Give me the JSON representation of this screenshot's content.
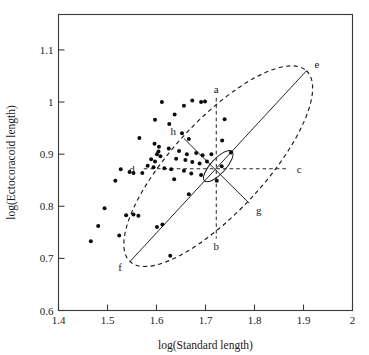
{
  "figure": {
    "kind": "scatter-plot-with-confidence-ellipse",
    "background": "#ffffff",
    "ink_color": "#1a1a1a"
  },
  "axes": {
    "x_title": "log(Standard length)",
    "y_title": "log(Ectocoracoid length)",
    "x_ticks": [
      "1.4",
      "1.5",
      "1.6",
      "1.7",
      "1.8",
      "1.9",
      "2"
    ],
    "y_ticks": [
      "0.6",
      "0.7",
      "0.8",
      "0.9",
      "1",
      "1.1"
    ]
  },
  "annotations": [
    {
      "key": "a",
      "label": "a",
      "x": 1.722,
      "y": 1.008,
      "anchor": "bottom-of-vertical-dashed-top"
    },
    {
      "key": "b",
      "label": "b",
      "x": 1.722,
      "y": 0.738,
      "anchor": "vertical-dashed-bottom"
    },
    {
      "key": "c",
      "label": "c",
      "x": 1.868,
      "y": 0.872,
      "anchor": "horizontal-dashed-right"
    },
    {
      "key": "d",
      "label": "d",
      "x": 1.574,
      "y": 0.872,
      "anchor": "horizontal-dashed-left"
    },
    {
      "key": "e",
      "label": "e",
      "x": 1.906,
      "y": 1.06,
      "anchor": "major-axis-upper-right"
    },
    {
      "key": "f",
      "label": "f",
      "x": 1.546,
      "y": 0.694,
      "anchor": "major-axis-lower-left"
    },
    {
      "key": "g",
      "label": "g",
      "x": 1.789,
      "y": 0.806,
      "anchor": "minor-axis-lower-right"
    },
    {
      "key": "h",
      "label": "h",
      "x": 1.656,
      "y": 0.93,
      "anchor": "minor-axis-upper-left"
    }
  ],
  "chart_data": {
    "type": "scatter",
    "title": "",
    "xlabel": "log(Standard length)",
    "ylabel": "log(Ectocoracoid length)",
    "xlim": [
      1.4,
      2.0
    ],
    "ylim": [
      0.6,
      1.168
    ],
    "xticks": [
      1.4,
      1.5,
      1.6,
      1.7,
      1.8,
      1.9,
      2.0
    ],
    "yticks": [
      0.6,
      0.7,
      0.8,
      0.9,
      1.0,
      1.1
    ],
    "grid": false,
    "legend": null,
    "marker": "filled-circle",
    "marker_color": "#0b0b0b",
    "points": [
      [
        1.611,
        1.0
      ],
      [
        1.673,
        1.003
      ],
      [
        1.691,
        1.0
      ],
      [
        1.699,
        1.001
      ],
      [
        1.637,
        0.976
      ],
      [
        1.656,
        0.993
      ],
      [
        1.739,
        0.967
      ],
      [
        1.597,
        0.966
      ],
      [
        1.626,
        0.958
      ],
      [
        1.652,
        0.94
      ],
      [
        1.565,
        0.931
      ],
      [
        1.596,
        0.92
      ],
      [
        1.666,
        0.929
      ],
      [
        1.734,
        0.926
      ],
      [
        1.605,
        0.914
      ],
      [
        1.625,
        0.911
      ],
      [
        1.646,
        0.906
      ],
      [
        1.662,
        0.9
      ],
      [
        1.681,
        0.902
      ],
      [
        1.694,
        0.898
      ],
      [
        1.712,
        0.9
      ],
      [
        1.752,
        0.903
      ],
      [
        1.601,
        0.9
      ],
      [
        1.604,
        0.905
      ],
      [
        1.608,
        0.896
      ],
      [
        1.589,
        0.89
      ],
      [
        1.597,
        0.886
      ],
      [
        1.64,
        0.891
      ],
      [
        1.659,
        0.889
      ],
      [
        1.673,
        0.885
      ],
      [
        1.688,
        0.882
      ],
      [
        1.703,
        0.886
      ],
      [
        1.733,
        0.877
      ],
      [
        1.582,
        0.878
      ],
      [
        1.594,
        0.875
      ],
      [
        1.616,
        0.873
      ],
      [
        1.63,
        0.871
      ],
      [
        1.527,
        0.871
      ],
      [
        1.545,
        0.866
      ],
      [
        1.553,
        0.864
      ],
      [
        1.571,
        0.864
      ],
      [
        1.656,
        0.868
      ],
      [
        1.671,
        0.863
      ],
      [
        1.691,
        0.86
      ],
      [
        1.516,
        0.849
      ],
      [
        1.636,
        0.852
      ],
      [
        1.723,
        0.849
      ],
      [
        1.666,
        0.823
      ],
      [
        1.494,
        0.796
      ],
      [
        1.538,
        0.783
      ],
      [
        1.553,
        0.784
      ],
      [
        1.563,
        0.782
      ],
      [
        1.481,
        0.762
      ],
      [
        1.601,
        0.76
      ],
      [
        1.612,
        0.765
      ],
      [
        1.524,
        0.744
      ],
      [
        1.466,
        0.733
      ],
      [
        1.628,
        0.705
      ]
    ],
    "confidence_ellipse": {
      "center": [
        1.722,
        0.872
      ],
      "semi_major": 0.258,
      "semi_minor": 0.098,
      "angle_deg": 45,
      "style": "dashed"
    },
    "inner_ellipse": {
      "center": [
        1.722,
        0.872
      ],
      "semi_major": 0.04,
      "semi_minor": 0.016,
      "angle_deg": 45,
      "style": "solid"
    },
    "major_axis": {
      "from": "f",
      "to": "e",
      "style": "solid"
    },
    "minor_axis": {
      "from": "h",
      "to": "g",
      "style": "solid"
    },
    "vertical_reference": {
      "from": "b",
      "to": "a",
      "style": "dashed"
    },
    "horizontal_reference": {
      "from": "d",
      "to": "c",
      "style": "dashed"
    }
  }
}
